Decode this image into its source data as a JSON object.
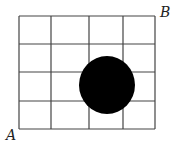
{
  "diagram": {
    "grid": {
      "columns": 4,
      "rows": 4,
      "x_lines": [
        19,
        51,
        89,
        123,
        155
      ],
      "y_lines": [
        16,
        44,
        72,
        101,
        129
      ],
      "stroke": "#444444"
    },
    "disk": {
      "cx": 107,
      "cy": 85,
      "rx": 28,
      "ry": 29,
      "fill": "#000000"
    },
    "labels": {
      "a": "A",
      "b": "B"
    }
  }
}
